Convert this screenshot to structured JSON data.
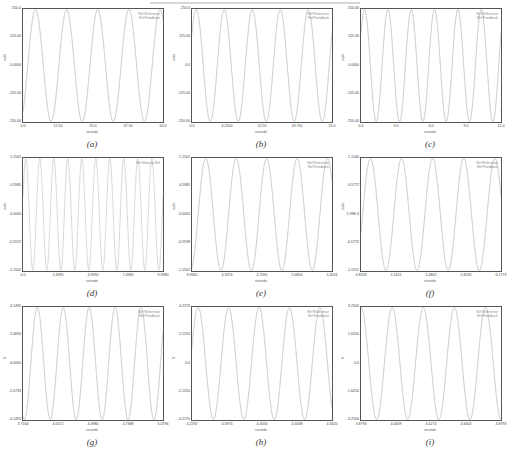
{
  "header": {
    "text": ""
  },
  "chart_data": [
    {
      "id": "a",
      "type": "line",
      "caption": "(a)",
      "xlabel": "seconds",
      "ylabel": "rad/s",
      "legend": [
        "Ref Reference",
        "Ref Feedback"
      ],
      "xticks": [
        "0.0",
        "12.50",
        "25.0",
        "37.50",
        "50.0"
      ],
      "yticks": [
        "250.0",
        "125.00",
        "0.0000",
        "-125.00",
        "-250.00"
      ],
      "xlim": [
        0,
        50
      ],
      "ylim": [
        -250,
        250
      ],
      "cycles": 4.5,
      "phase": -0.15,
      "series": [
        {
          "name": "Ref Reference",
          "color": "#c8c8c8"
        },
        {
          "name": "Ref Feedback",
          "color": "#b0b0b0"
        }
      ]
    },
    {
      "id": "b",
      "type": "line",
      "caption": "(b)",
      "xlabel": "seconds",
      "ylabel": "rad/s",
      "legend": [
        "Ref Reference",
        "Ref Feedback"
      ],
      "xticks": [
        "0.0",
        "6.2500",
        "12.50",
        "18.750",
        "25.0"
      ],
      "yticks": [
        "250.0",
        "125.00",
        "0.0",
        "-125.00",
        "-250.00"
      ],
      "xlim": [
        0,
        25
      ],
      "ylim": [
        -250,
        250
      ],
      "cycles": 5,
      "phase": 0.1,
      "series": [
        {
          "name": "Ref Reference",
          "color": "#c8c8c8"
        },
        {
          "name": "Ref Feedback",
          "color": "#b0b0b0"
        }
      ]
    },
    {
      "id": "c",
      "type": "line",
      "caption": "(c)",
      "xlabel": "seconds",
      "ylabel": "rad/s",
      "legend": [
        "Ref Reference",
        "Ref Feedback"
      ],
      "xticks": [
        "0.0",
        "3.0",
        "6.0",
        "9.0",
        "12.0"
      ],
      "yticks": [
        "250.00",
        "125.00",
        "0.0000",
        "-125.00",
        "-250.00"
      ],
      "xlim": [
        0,
        12
      ],
      "ylim": [
        -250,
        250
      ],
      "cycles": 6,
      "phase": 0.1,
      "series": [
        {
          "name": "Ref Reference",
          "color": "#c8c8c8"
        },
        {
          "name": "Ref Feedback",
          "color": "#b0b0b0"
        }
      ]
    },
    {
      "id": "d",
      "type": "line",
      "caption": "(d)",
      "xlabel": "seconds",
      "ylabel": "rad/s",
      "legend": [
        "Ref Velocity Ref"
      ],
      "xticks": [
        "0.0",
        "2.4995",
        "4.9990",
        "7.4985",
        "9.9980"
      ],
      "yticks": [
        "1.1502",
        "0.5985",
        "0.0000",
        "-0.5572",
        "-1.1502"
      ],
      "xlim": [
        0,
        10
      ],
      "ylim": [
        -1.15,
        1.15
      ],
      "cycles": 10,
      "phase": 0.05,
      "series": [
        {
          "name": "Ref Velocity Ref",
          "color": "#c0c0c0"
        }
      ]
    },
    {
      "id": "e",
      "type": "line",
      "caption": "(e)",
      "xlabel": "seconds",
      "ylabel": "rad/s",
      "legend": [
        "Ref Reference",
        "Ref Feedback"
      ],
      "xticks": [
        "3.9662",
        "4.3374",
        "4.7091",
        "5.0804",
        "5.4516"
      ],
      "yticks": [
        "1.1502",
        "0.5985",
        "0.0000",
        "-0.5598",
        "-1.1502"
      ],
      "xlim": [
        3.966,
        5.452
      ],
      "ylim": [
        -1.15,
        1.15
      ],
      "cycles": 4.6,
      "phase": -0.2,
      "series": [
        {
          "name": "Ref Reference",
          "color": "#c8c8c8"
        },
        {
          "name": "Ref Feedback",
          "color": "#b0b0b0"
        }
      ]
    },
    {
      "id": "f",
      "type": "line",
      "caption": "(f)",
      "xlabel": "seconds",
      "ylabel": "rad/s",
      "legend": [
        "Ref Reference",
        "Ref Feedback"
      ],
      "xticks": [
        "4.8209",
        "5.1622",
        "5.4802",
        "5.8235",
        "6.1773"
      ],
      "yticks": [
        "1.1540",
        "0.5772",
        "1.99E-4",
        "-0.5772",
        "-1.1552"
      ],
      "xlim": [
        4.82,
        6.177
      ],
      "ylim": [
        -1.15,
        1.15
      ],
      "cycles": 4.5,
      "phase": -0.05,
      "series": [
        {
          "name": "Ref Reference",
          "color": "#c8c8c8"
        },
        {
          "name": "Ref Feedback",
          "color": "#b0b0b0"
        }
      ]
    },
    {
      "id": "g",
      "type": "line",
      "caption": "(g)",
      "xlabel": "seconds",
      "ylabel": "N",
      "legend": [
        "Ref Reference",
        "Ref Feedback"
      ],
      "xticks": [
        "3.7164",
        "4.0572",
        "4.3980",
        "4.7388",
        "5.0796"
      ],
      "yticks": [
        "4.1495",
        "2.0690",
        "0.0000",
        "-2.0733",
        "-4.1495"
      ],
      "xlim": [
        3.716,
        5.08
      ],
      "ylim": [
        -4.15,
        4.15
      ],
      "cycles": 5.4,
      "phase": -0.3,
      "series": [
        {
          "name": "Ref Reference",
          "color": "#c8c8c8"
        },
        {
          "name": "Ref Feedback",
          "color": "#b0b0b0"
        }
      ]
    },
    {
      "id": "h",
      "type": "line",
      "caption": "(h)",
      "xlabel": "seconds",
      "ylabel": "N",
      "legend": [
        "Ref Reference",
        "Ref Feedback"
      ],
      "xticks": [
        "4.2292",
        "4.3974",
        "4.4656",
        "4.5638",
        "4.5620"
      ],
      "yticks": [
        "4.2270",
        "2.1250",
        "0.0",
        "-2.1250",
        "-4.2270"
      ],
      "xlim": [
        4.229,
        4.562
      ],
      "ylim": [
        -4.23,
        4.23
      ],
      "cycles": 4.6,
      "phase": 0.05,
      "series": [
        {
          "name": "Ref Reference",
          "color": "#c8c8c8"
        },
        {
          "name": "Ref Feedback",
          "color": "#b0b0b0"
        }
      ]
    },
    {
      "id": "i",
      "type": "line",
      "caption": "(i)",
      "xlabel": "seconds",
      "ylabel": "N",
      "legend": [
        "Ref Reference",
        "Ref Feedback"
      ],
      "xticks": [
        "3.8793",
        "4.0609",
        "4.4274",
        "4.6602",
        "4.8793"
      ],
      "yticks": [
        "3.2500",
        "1.6250",
        "0.0",
        "-1.6250",
        "-3.2500"
      ],
      "xlim": [
        3.879,
        4.879
      ],
      "ylim": [
        -3.25,
        3.25
      ],
      "cycles": 4.5,
      "phase": 0.25,
      "series": [
        {
          "name": "Ref Reference",
          "color": "#c8c8c8"
        },
        {
          "name": "Ref Feedback",
          "color": "#b0b0b0"
        }
      ]
    }
  ]
}
